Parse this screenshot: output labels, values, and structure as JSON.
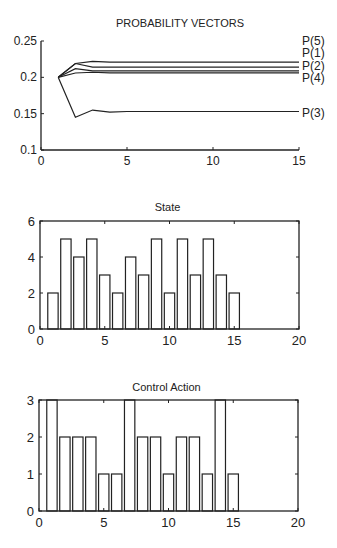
{
  "chart_data": [
    {
      "type": "line",
      "title": "PROBABILITY VECTORS",
      "xlabel": "",
      "ylabel": "",
      "xlim": [
        0,
        15
      ],
      "ylim": [
        0.1,
        0.25
      ],
      "xticks": [
        0,
        5,
        10,
        15
      ],
      "yticks": [
        0.1,
        0.15,
        0.2,
        0.25
      ],
      "ytick_labels": [
        "0.1",
        "0.15",
        "0.2",
        "0.25"
      ],
      "grid": false,
      "legend_position": "right end labels",
      "x": [
        1,
        2,
        3,
        4,
        5,
        6,
        7,
        8,
        9,
        10,
        11,
        12,
        13,
        14,
        15
      ],
      "series": [
        {
          "name": "P(5)",
          "values": [
            0.2,
            0.219,
            0.222,
            0.221,
            0.221,
            0.221,
            0.221,
            0.221,
            0.221,
            0.221,
            0.221,
            0.221,
            0.221,
            0.221,
            0.221
          ]
        },
        {
          "name": "P(1)",
          "values": [
            0.2,
            0.219,
            0.214,
            0.214,
            0.214,
            0.214,
            0.214,
            0.214,
            0.214,
            0.214,
            0.214,
            0.214,
            0.214,
            0.214,
            0.214
          ]
        },
        {
          "name": "P(2)",
          "values": [
            0.2,
            0.212,
            0.209,
            0.209,
            0.209,
            0.209,
            0.209,
            0.209,
            0.209,
            0.209,
            0.209,
            0.209,
            0.209,
            0.209,
            0.209
          ]
        },
        {
          "name": "P(4)",
          "values": [
            0.2,
            0.206,
            0.207,
            0.206,
            0.206,
            0.206,
            0.206,
            0.206,
            0.206,
            0.206,
            0.206,
            0.206,
            0.206,
            0.206,
            0.206
          ]
        },
        {
          "name": "P(3)",
          "values": [
            0.2,
            0.145,
            0.155,
            0.152,
            0.153,
            0.153,
            0.153,
            0.153,
            0.153,
            0.153,
            0.153,
            0.153,
            0.153,
            0.153,
            0.153
          ]
        }
      ]
    },
    {
      "type": "bar",
      "title": "State",
      "xlabel": "",
      "ylabel": "",
      "xlim": [
        0,
        20
      ],
      "ylim": [
        0,
        6
      ],
      "xticks": [
        0,
        5,
        10,
        15,
        20
      ],
      "yticks": [
        0,
        2,
        4,
        6
      ],
      "grid": false,
      "categories": [
        1,
        2,
        3,
        4,
        5,
        6,
        7,
        8,
        9,
        10,
        11,
        12,
        13,
        14,
        15
      ],
      "values": [
        2,
        5,
        4,
        5,
        3,
        2,
        4,
        3,
        5,
        2,
        5,
        3,
        5,
        3,
        2
      ]
    },
    {
      "type": "bar",
      "title": "Control Action",
      "xlabel": "",
      "ylabel": "",
      "xlim": [
        0,
        20
      ],
      "ylim": [
        0,
        3
      ],
      "xticks": [
        0,
        5,
        10,
        15,
        20
      ],
      "yticks": [
        0,
        1,
        2,
        3
      ],
      "grid": false,
      "categories": [
        1,
        2,
        3,
        4,
        5,
        6,
        7,
        8,
        9,
        10,
        11,
        12,
        13,
        14,
        15
      ],
      "values": [
        3,
        2,
        2,
        2,
        1,
        1,
        3,
        2,
        2,
        1,
        2,
        2,
        1,
        3,
        1
      ]
    }
  ],
  "colors": {
    "line": "#222222",
    "background": "#ffffff"
  }
}
